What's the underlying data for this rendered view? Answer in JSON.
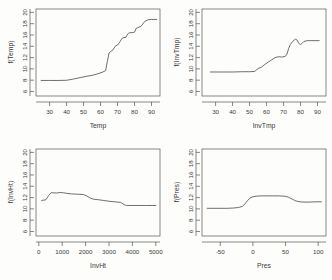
{
  "figure": {
    "layout": "2x2 panel grid",
    "background_color": "#fdfdfc",
    "line_color": "#4a4a4a",
    "axis_color": "#555555"
  },
  "chart_data": [
    {
      "type": "line",
      "title": "",
      "xlabel": "Temp",
      "ylabel": "f(Temp)",
      "xlim": [
        22,
        95
      ],
      "ylim": [
        5.2,
        20.6
      ],
      "xticks": [
        30,
        40,
        50,
        60,
        70,
        80,
        90
      ],
      "yticks": [
        6,
        8,
        10,
        12,
        14,
        16,
        18,
        20
      ],
      "grid": false,
      "legend": "none",
      "x": [
        25,
        30,
        35,
        40,
        44,
        48,
        52,
        55,
        58,
        61,
        63,
        64,
        65,
        66,
        67,
        68,
        69,
        70,
        71,
        72,
        73,
        75,
        76,
        77,
        78,
        80,
        81,
        82,
        84,
        86,
        88,
        90,
        93
      ],
      "y": [
        7.95,
        7.95,
        7.95,
        7.98,
        8.2,
        8.45,
        8.7,
        8.85,
        9.1,
        9.4,
        9.7,
        11.3,
        12.8,
        13.1,
        13.25,
        13.7,
        14.1,
        14.2,
        14.6,
        15.1,
        15.5,
        15.6,
        16.2,
        16.4,
        16.4,
        16.5,
        17.2,
        17.3,
        17.6,
        18.4,
        18.7,
        18.75,
        18.75
      ]
    },
    {
      "type": "line",
      "title": "",
      "xlabel": "InvTmp",
      "ylabel": "f(InvTmp)",
      "xlim": [
        22,
        95
      ],
      "ylim": [
        5.2,
        20.6
      ],
      "xticks": [
        30,
        40,
        50,
        60,
        70,
        80,
        90
      ],
      "yticks": [
        6,
        8,
        10,
        12,
        14,
        16,
        18,
        20
      ],
      "grid": false,
      "legend": "none",
      "x": [
        27,
        33,
        40,
        46,
        50,
        53,
        55,
        57,
        59,
        61,
        63,
        65,
        67,
        69,
        71,
        72,
        73,
        74,
        75,
        76,
        77,
        78,
        79,
        80,
        81,
        82,
        84,
        86,
        88,
        91
      ],
      "y": [
        9.45,
        9.45,
        9.45,
        9.5,
        9.5,
        9.55,
        10.05,
        10.3,
        10.8,
        11.2,
        11.6,
        12.0,
        12.15,
        12.1,
        12.2,
        12.6,
        13.6,
        14.3,
        14.7,
        15.05,
        15.25,
        15.1,
        14.5,
        14.3,
        14.55,
        14.85,
        15.0,
        15.0,
        15.0,
        15.0
      ]
    },
    {
      "type": "line",
      "title": "",
      "xlabel": "InvHt",
      "ylabel": "f(InvHt)",
      "xlim": [
        -120,
        5180
      ],
      "ylim": [
        5.2,
        20.6
      ],
      "xticks": [
        0,
        1000,
        2000,
        3000,
        4000,
        5000
      ],
      "yticks": [
        6,
        8,
        10,
        12,
        14,
        16,
        18,
        20
      ],
      "grid": false,
      "legend": "none",
      "x": [
        120,
        300,
        420,
        520,
        620,
        750,
        900,
        1050,
        1200,
        1400,
        1650,
        1900,
        2050,
        2200,
        2350,
        2500,
        2750,
        3000,
        3250,
        3500,
        3650,
        3750,
        3900,
        4200,
        4600,
        5000
      ],
      "y": [
        11.5,
        11.6,
        12.35,
        12.85,
        12.85,
        12.8,
        12.9,
        12.85,
        12.75,
        12.65,
        12.6,
        12.55,
        12.3,
        11.9,
        11.7,
        11.65,
        11.5,
        11.35,
        11.25,
        11.15,
        10.75,
        10.6,
        10.6,
        10.6,
        10.6,
        10.6
      ]
    },
    {
      "type": "line",
      "title": "",
      "xlabel": "Pres",
      "ylabel": "f(Pres)",
      "xlim": [
        -78,
        112
      ],
      "ylim": [
        5.2,
        20.6
      ],
      "xticks": [
        -50,
        0,
        50,
        100
      ],
      "yticks": [
        6,
        8,
        10,
        12,
        14,
        16,
        18,
        20
      ],
      "grid": false,
      "legend": "none",
      "x": [
        -70,
        -55,
        -40,
        -30,
        -22,
        -16,
        -12,
        -8,
        -4,
        0,
        5,
        12,
        20,
        30,
        40,
        48,
        54,
        60,
        66,
        72,
        78,
        86,
        95,
        105
      ],
      "y": [
        10.1,
        10.1,
        10.1,
        10.15,
        10.25,
        10.45,
        10.9,
        11.5,
        11.95,
        12.15,
        12.25,
        12.3,
        12.3,
        12.3,
        12.3,
        12.25,
        12.1,
        11.75,
        11.4,
        11.25,
        11.2,
        11.2,
        11.25,
        11.25
      ]
    }
  ]
}
